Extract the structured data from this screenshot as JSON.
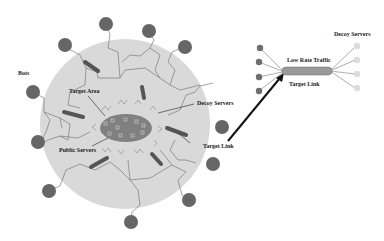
{
  "labels": {
    "bots": "Bots",
    "target_area": "Target Area",
    "decoy_servers": "Decoy Servers",
    "public_servers": "Public Servers",
    "target_link": "Target Link",
    "inset_low_rate_traffic": "Low Rate Traffic",
    "inset_target_link": "Target Link",
    "inset_decoy_servers": "Decoy Servers"
  },
  "colors": {
    "background": "#ffffff",
    "network_cloud": "#d9d9d9",
    "bot_node": "#666666",
    "server_bar": "#555555",
    "target_area": "#808080",
    "link_lines": "#7a7a7a",
    "arrow": "#111111",
    "inset_bot": "#6e6e6e",
    "inset_decoy": "#dcdcdc",
    "inset_link": "#9a9a9a"
  },
  "diagram": {
    "bots_count": 12,
    "public_server_bars": 6,
    "target_area_servers": 10,
    "inset_sources": 4,
    "inset_decoys": 4
  }
}
